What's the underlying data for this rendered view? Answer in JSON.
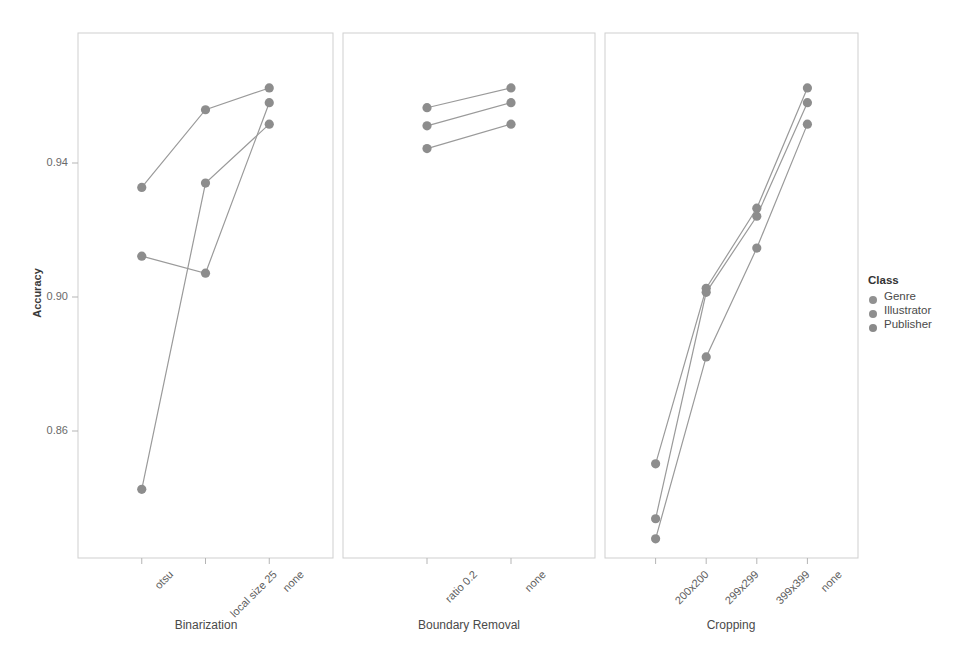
{
  "chart_data": {
    "type": "line",
    "title": "",
    "subtitle": "",
    "xlabel": "",
    "ylabel": "Accuracy",
    "ylim": [
      0.838,
      0.967
    ],
    "yticks": [
      0.86,
      0.9,
      0.94
    ],
    "ytick_labels": [
      "0.86",
      "0.90",
      "0.94"
    ],
    "grid": false,
    "legend_position": "right",
    "legend_title": "Class",
    "series_names": [
      "Genre",
      "Illustrator",
      "Publisher"
    ],
    "marker": "circle",
    "panels": [
      {
        "facet_label": "Binarization",
        "categories": [
          "otsu",
          "local size 25",
          "none"
        ],
        "series": [
          {
            "name": "Genre",
            "values": [
              0.9327,
              0.9559,
              0.9624
            ]
          },
          {
            "name": "Illustrator",
            "values": [
              0.9122,
              0.9071,
              0.958
            ]
          },
          {
            "name": "Publisher",
            "values": [
              0.8426,
              0.934,
              0.9516
            ]
          }
        ]
      },
      {
        "facet_label": "Boundary Removal",
        "categories": [
          "ratio 0.2",
          "none"
        ],
        "series": [
          {
            "name": "Genre",
            "values": [
              0.9565,
              0.9624
            ]
          },
          {
            "name": "Illustrator",
            "values": [
              0.9511,
              0.958
            ]
          },
          {
            "name": "Publisher",
            "values": [
              0.9443,
              0.9516
            ]
          }
        ]
      },
      {
        "facet_label": "Cropping",
        "categories": [
          "200x200",
          "299x299",
          "399x399",
          "none"
        ],
        "series": [
          {
            "name": "Genre",
            "values": [
              0.8502,
              0.9026,
              0.9265,
              0.9624
            ]
          },
          {
            "name": "Illustrator",
            "values": [
              0.8338,
              0.9014,
              0.9241,
              0.958
            ]
          },
          {
            "name": "Publisher",
            "values": [
              0.8278,
              0.8821,
              0.9146,
              0.9516
            ]
          }
        ]
      }
    ]
  },
  "axes": {
    "y_title": "Accuracy",
    "y_tick_labels": [
      "0.94",
      "0.90",
      "0.86"
    ]
  },
  "facets": {
    "labels": [
      "Binarization",
      "Boundary Removal",
      "Cropping"
    ]
  },
  "legend": {
    "title": "Class",
    "items": [
      {
        "label": "Genre",
        "color": "#919191"
      },
      {
        "label": "Illustrator",
        "color": "#8e8e8e"
      },
      {
        "label": "Publisher",
        "color": "#8a8a8a"
      }
    ]
  },
  "style": {
    "point_color": "#8d8d8d",
    "line_color": "#9a9a9a",
    "panel_border": "#cfcfcf",
    "background": "#ffffff"
  },
  "x_tick_labels": {
    "panel1": [
      "otsu",
      "local size 25",
      "none"
    ],
    "panel2": [
      "ratio 0.2",
      "none"
    ],
    "panel3": [
      "200x200",
      "299x299",
      "399x399",
      "none"
    ]
  }
}
